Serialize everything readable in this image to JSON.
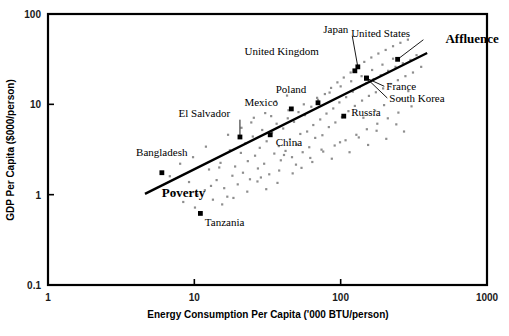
{
  "figure": {
    "caption": "",
    "background": "#ffffff"
  },
  "chart_data": {
    "type": "scatter",
    "title": "",
    "xlabel": "Energy Consumption Per Capita ('000 BTU/person)",
    "ylabel": "GDP Per Capita ($000/person)",
    "xscale": "log",
    "yscale": "log",
    "xlim": [
      1,
      1000
    ],
    "ylim": [
      0.1,
      100
    ],
    "xticks": [
      "1",
      "10",
      "100",
      "1000"
    ],
    "xtick_values": [
      1,
      10,
      100,
      1000
    ],
    "yticks": [
      "0.1",
      "1",
      "10",
      "100"
    ],
    "ytick_values": [
      0.1,
      1,
      10,
      100
    ],
    "grid": false,
    "legend": null,
    "marker_colors": {
      "unlabeled_point": "#8e8e8e",
      "labeled_point": "#000000",
      "trendline": "#000000",
      "frame": "#000000"
    },
    "annotations": [
      {
        "text": "Poverty",
        "x": 6.0,
        "y": 0.95,
        "style": "bold",
        "name": "poverty-annotation"
      },
      {
        "text": "Affluence",
        "x": 520,
        "y": 48,
        "style": "bold",
        "name": "affluence-annotation"
      }
    ],
    "trendline": {
      "label": "development trend",
      "x_start": 4.6,
      "y_start": 1.02,
      "x_end": 390,
      "y_end": 37.0
    },
    "labeled_points": [
      {
        "name": "Bangladesh",
        "x": 6.0,
        "y": 1.75,
        "label_x": 4.0,
        "label_y": 2.65,
        "leader": false
      },
      {
        "name": "Tanzania",
        "x": 11.0,
        "y": 0.62,
        "label_x": 11.8,
        "label_y": 0.45,
        "leader": false
      },
      {
        "name": "El Salvador",
        "x": 20.5,
        "y": 4.35,
        "label_x": 7.8,
        "label_y": 7.3,
        "leader": true
      },
      {
        "name": "Mexico",
        "x": 46.0,
        "y": 8.9,
        "label_x": 22.0,
        "label_y": 9.6,
        "leader": false
      },
      {
        "name": "China",
        "x": 33.0,
        "y": 4.6,
        "label_x": 36.0,
        "label_y": 3.5,
        "leader": false
      },
      {
        "name": "Poland",
        "x": 70.0,
        "y": 10.4,
        "label_x": 36.0,
        "label_y": 13.4,
        "leader": false
      },
      {
        "name": "Russia",
        "x": 105.0,
        "y": 7.4,
        "label_x": 118,
        "label_y": 7.4,
        "leader": false
      },
      {
        "name": "United Kingdom",
        "x": 125.0,
        "y": 23.5,
        "label_x": 22.0,
        "label_y": 35.0,
        "leader": false
      },
      {
        "name": "Japan",
        "x": 131.0,
        "y": 26.0,
        "label_x": 76.0,
        "label_y": 62.0,
        "leader": true
      },
      {
        "name": "France",
        "x": 150.0,
        "y": 19.5,
        "label_x": 205,
        "label_y": 14.3,
        "leader": true
      },
      {
        "name": "South Korea",
        "x": 150.0,
        "y": 19.5,
        "label_x": 215,
        "label_y": 10.6,
        "leader": true
      },
      {
        "name": "United States",
        "x": 245.0,
        "y": 31.5,
        "label_x": 118,
        "label_y": 56.0,
        "leader": true
      }
    ],
    "unlabeled_points": [
      [
        7.3,
        1.05
      ],
      [
        8.4,
        0.83
      ],
      [
        9.2,
        1.38
      ],
      [
        10.1,
        0.72
      ],
      [
        11.8,
        1.12
      ],
      [
        12.6,
        1.9
      ],
      [
        13.4,
        0.88
      ],
      [
        14.2,
        1.45
      ],
      [
        15.1,
        2.25
      ],
      [
        16.0,
        1.18
      ],
      [
        16.8,
        0.95
      ],
      [
        17.5,
        3.1
      ],
      [
        18.2,
        1.62
      ],
      [
        19.0,
        2.05
      ],
      [
        19.8,
        1.3
      ],
      [
        20.8,
        2.9
      ],
      [
        21.5,
        1.75
      ],
      [
        22.3,
        3.7
      ],
      [
        23.2,
        2.35
      ],
      [
        24.0,
        1.48
      ],
      [
        25.1,
        4.4
      ],
      [
        26.0,
        2.7
      ],
      [
        27.2,
        1.95
      ],
      [
        28.0,
        3.3
      ],
      [
        29.1,
        5.2
      ],
      [
        30.0,
        2.2
      ],
      [
        31.2,
        3.9
      ],
      [
        32.5,
        1.68
      ],
      [
        34.0,
        4.9
      ],
      [
        35.2,
        2.85
      ],
      [
        36.5,
        6.1
      ],
      [
        37.8,
        3.45
      ],
      [
        39.0,
        2.4
      ],
      [
        40.5,
        5.4
      ],
      [
        42.0,
        3.05
      ],
      [
        43.5,
        7.0
      ],
      [
        45.0,
        4.1
      ],
      [
        46.5,
        2.6
      ],
      [
        48.0,
        6.4
      ],
      [
        50.0,
        3.6
      ],
      [
        51.5,
        8.2
      ],
      [
        53.0,
        4.7
      ],
      [
        55.0,
        2.95
      ],
      [
        57.0,
        7.6
      ],
      [
        59.0,
        5.0
      ],
      [
        61.0,
        3.35
      ],
      [
        63.0,
        9.4
      ],
      [
        65.0,
        5.9
      ],
      [
        67.0,
        4.25
      ],
      [
        70.0,
        11.2
      ],
      [
        72.5,
        6.8
      ],
      [
        75.0,
        4.55
      ],
      [
        78.0,
        13.0
      ],
      [
        80.0,
        7.9
      ],
      [
        83.0,
        5.6
      ],
      [
        86.0,
        15.2
      ],
      [
        89.0,
        9.0
      ],
      [
        92.0,
        6.3
      ],
      [
        95.0,
        17.5
      ],
      [
        98.0,
        10.5
      ],
      [
        102,
        7.2
      ],
      [
        105,
        19.8
      ],
      [
        109,
        12.0
      ],
      [
        113,
        8.4
      ],
      [
        117,
        22.5
      ],
      [
        121,
        13.8
      ],
      [
        125,
        9.6
      ],
      [
        130,
        26.0
      ],
      [
        135,
        15.5
      ],
      [
        140,
        11.0
      ],
      [
        145,
        29.5
      ],
      [
        150,
        17.2
      ],
      [
        156,
        12.4
      ],
      [
        162,
        33.0
      ],
      [
        168,
        19.0
      ],
      [
        174,
        13.6
      ],
      [
        181,
        36.5
      ],
      [
        188,
        21.0
      ],
      [
        195,
        15.0
      ],
      [
        203,
        40.0
      ],
      [
        211,
        23.5
      ],
      [
        219,
        16.8
      ],
      [
        228,
        44.0
      ],
      [
        237,
        26.0
      ],
      [
        246,
        18.5
      ],
      [
        256,
        48.0
      ],
      [
        266,
        28.5
      ],
      [
        277,
        20.5
      ],
      [
        288,
        52.0
      ],
      [
        300,
        31.0
      ],
      [
        312,
        22.5
      ],
      [
        9.8,
        2.6
      ],
      [
        12.0,
        3.4
      ],
      [
        14.8,
        2.0
      ],
      [
        17.0,
        4.6
      ],
      [
        21.0,
        5.5
      ],
      [
        24.5,
        6.3
      ],
      [
        28.5,
        1.55
      ],
      [
        33.5,
        7.4
      ],
      [
        38.0,
        1.85
      ],
      [
        44.0,
        8.6
      ],
      [
        49.5,
        2.15
      ],
      [
        56.0,
        10.0
      ],
      [
        62.0,
        2.55
      ],
      [
        69.0,
        11.8
      ],
      [
        76.0,
        3.0
      ],
      [
        84.0,
        13.5
      ],
      [
        91.0,
        3.5
      ],
      [
        100,
        15.8
      ],
      [
        108,
        4.0
      ],
      [
        118,
        18.0
      ],
      [
        128,
        4.6
      ],
      [
        139,
        20.5
      ],
      [
        151,
        5.3
      ],
      [
        164,
        24.0
      ],
      [
        178,
        6.1
      ],
      [
        193,
        27.5
      ],
      [
        210,
        7.0
      ],
      [
        228,
        32.0
      ],
      [
        248,
        8.1
      ],
      [
        6.8,
        1.6
      ],
      [
        8.0,
        2.2
      ],
      [
        10.5,
        1.0
      ],
      [
        13.0,
        1.25
      ],
      [
        15.5,
        0.78
      ],
      [
        18.5,
        0.92
      ],
      [
        23.0,
        1.08
      ],
      [
        27.0,
        1.4
      ],
      [
        31.0,
        1.15
      ],
      [
        37.0,
        1.35
      ],
      [
        41.0,
        2.75
      ],
      [
        47.0,
        1.72
      ],
      [
        54.0,
        1.98
      ],
      [
        64.0,
        2.3
      ],
      [
        74.0,
        3.15
      ],
      [
        87.0,
        2.5
      ],
      [
        99.0,
        3.8
      ],
      [
        115,
        2.95
      ],
      [
        133,
        4.3
      ],
      [
        154,
        3.55
      ],
      [
        176,
        5.1
      ],
      [
        205,
        4.15
      ],
      [
        240,
        6.0
      ],
      [
        271,
        5.0
      ],
      [
        330,
        35.0
      ],
      [
        355,
        26.0
      ],
      [
        290,
        14.0
      ],
      [
        260,
        11.5
      ],
      [
        305,
        9.5
      ],
      [
        198,
        9.8
      ],
      [
        172,
        8.5
      ],
      [
        143,
        7.1
      ],
      [
        36.0,
        10.8
      ],
      [
        43.0,
        12.5
      ],
      [
        30.5,
        8.0
      ],
      [
        25.5,
        7.1
      ]
    ]
  }
}
